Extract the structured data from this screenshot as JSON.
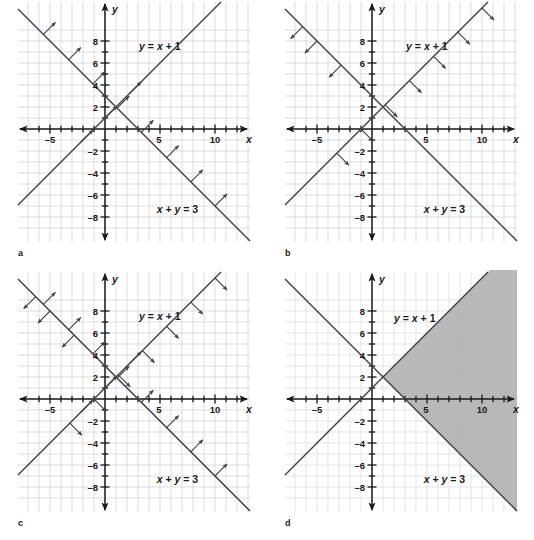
{
  "figure": {
    "width": 534,
    "height": 540,
    "background": "#ffffff",
    "grid_color": "#cfcfd4",
    "axis_color": "#1a1a1a",
    "line_color": "#404048",
    "shade_color": "#b2b2b2"
  },
  "chart_data": {
    "type": "line",
    "title": "",
    "xlabel": "x",
    "ylabel": "y",
    "xlim": [
      -7,
      13
    ],
    "ylim": [
      -9,
      9
    ],
    "grid": true,
    "legend": "none",
    "x_ticks": [
      -5,
      5,
      10
    ],
    "y_ticks": [
      -8,
      -6,
      -4,
      -2,
      2,
      4,
      6,
      8
    ],
    "x_tick_labels": [
      "–5",
      "5",
      "10"
    ],
    "y_tick_labels": [
      "–8",
      "–6",
      "–4",
      "–2",
      "2",
      "4",
      "6",
      "8"
    ],
    "series": [
      {
        "name": "y = x + 1",
        "label": "y = x + 1",
        "slope": 1,
        "intercept": 1,
        "points": [
          [
            -7,
            -6
          ],
          [
            13,
            14
          ]
        ]
      },
      {
        "name": "x + y = 3",
        "label": "x + y = 3",
        "slope": -1,
        "intercept": 3,
        "points": [
          [
            -7,
            10
          ],
          [
            13,
            -10
          ]
        ]
      }
    ],
    "intersection": [
      1,
      2
    ],
    "panels": [
      {
        "letter": "a",
        "caption": "a",
        "shaded": false,
        "arrows": [
          {
            "line": "x + y = 3",
            "direction": "northeast",
            "count": 4
          },
          {
            "line": "y = x + 1",
            "direction": "northeast",
            "count": 6
          }
        ]
      },
      {
        "letter": "b",
        "caption": "b",
        "shaded": false,
        "arrows": [
          {
            "line": "y = x + 1",
            "direction": "southeast",
            "count": 6
          },
          {
            "line": "x + y = 3",
            "direction": "southwest",
            "count": 4
          }
        ]
      },
      {
        "letter": "c",
        "caption": "c",
        "shaded": false,
        "arrows": [
          {
            "line": "x + y = 3",
            "direction": "northeast",
            "count": 7
          },
          {
            "line": "y = x + 1",
            "direction": "southeast",
            "count": 7
          },
          {
            "line": "x + y = 3",
            "direction": "southwest",
            "count": 4
          },
          {
            "line": "y = x + 1",
            "direction": "northeast",
            "count": 3
          }
        ]
      },
      {
        "letter": "d",
        "caption": "d",
        "shaded": true,
        "shade_region": "right of y = x + 1 and right of x + y = 3",
        "arrows": []
      }
    ]
  },
  "labels": {
    "line1": "y = x + 1",
    "line1_lhs": "y",
    "line1_eq": "=",
    "line1_rhs_a": "x",
    "line1_plus": "+",
    "line1_rhs_b": "1",
    "line2": "x + y = 3",
    "line2_a": "x",
    "line2_plus": "+",
    "line2_b": "y",
    "line2_eq": "=",
    "line2_c": "3",
    "axis_x": "x",
    "axis_y": "y"
  },
  "panel_letters": {
    "a": "a",
    "b": "b",
    "c": "c",
    "d": "d"
  },
  "tick_text": {
    "x_neg5": "–5",
    "x_5": "5",
    "x_10": "10",
    "y_8": "8",
    "y_6": "6",
    "y_4": "4",
    "y_2": "2",
    "y_neg2": "–2",
    "y_neg4": "–4",
    "y_neg6": "–6",
    "y_neg8": "–8"
  }
}
